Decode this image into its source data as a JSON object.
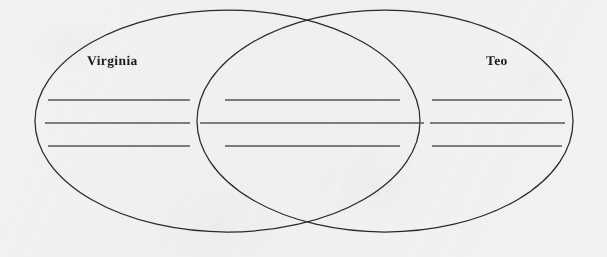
{
  "diagram": {
    "type": "venn-two-set",
    "title": "",
    "background_color": "#f2f2f0",
    "stroke_color": "#2a2a2a",
    "rule_color": "#555555",
    "label_color": "#1b1b1b",
    "sets": [
      {
        "id": "left",
        "label": "Virginia",
        "label_x": 87,
        "label_y": 53,
        "ellipse": {
          "cx": 227.5,
          "cy": 121,
          "rx": 192.5,
          "ry": 111
        }
      },
      {
        "id": "right",
        "label": "Teo",
        "label_x": 486,
        "label_y": 53,
        "ellipse": {
          "cx": 385,
          "cy": 121,
          "rx": 188,
          "ry": 111
        }
      }
    ],
    "intersection_points": [
      {
        "x": 305,
        "y": 22
      },
      {
        "x": 308,
        "y": 228
      }
    ],
    "regions": [
      {
        "id": "left-only",
        "set": "Virginia",
        "writing_lines": [
          {
            "x1": 48,
            "x2": 190,
            "y": 100
          },
          {
            "x1": 45,
            "x2": 190,
            "y": 123
          },
          {
            "x1": 48,
            "x2": 190,
            "y": 146
          }
        ]
      },
      {
        "id": "intersection",
        "set": "Both",
        "writing_lines": [
          {
            "x1": 225,
            "x2": 400,
            "y": 100
          },
          {
            "x1": 200,
            "x2": 424,
            "y": 123
          },
          {
            "x1": 225,
            "x2": 400,
            "y": 146
          }
        ]
      },
      {
        "id": "right-only",
        "set": "Teo",
        "writing_lines": [
          {
            "x1": 432,
            "x2": 562,
            "y": 100
          },
          {
            "x1": 430,
            "x2": 565,
            "y": 123
          },
          {
            "x1": 432,
            "x2": 562,
            "y": 146
          }
        ]
      }
    ]
  }
}
